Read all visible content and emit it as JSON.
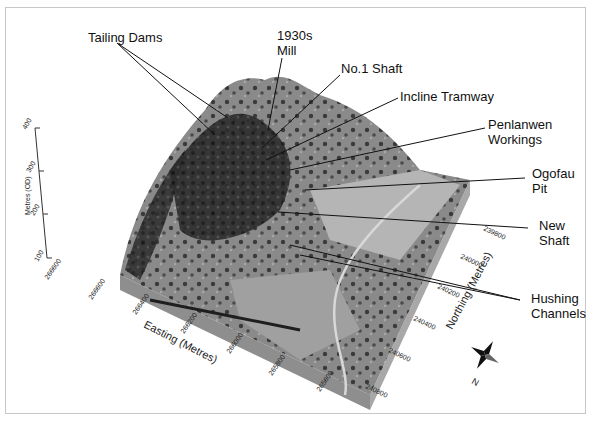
{
  "figure": {
    "type": "3D terrain model with aerial photo drape",
    "labels": {
      "tailing_dams": "Tailing Dams",
      "mill_l1": "1930s",
      "mill_l2": "Mill",
      "no1_shaft": "No.1 Shaft",
      "incline_tramway": "Incline Tramway",
      "penlanwen_l1": "Penlanwen",
      "penlanwen_l2": "Workings",
      "ogofau_l1": "Ogofau",
      "ogofau_l2": "Pit",
      "new_shaft_l1": "New",
      "new_shaft_l2": "Shaft",
      "hushing_l1": "Hushing",
      "hushing_l2": "Channels"
    },
    "axes": {
      "easting": {
        "title": "Easting (Metres)",
        "ticks": [
          "266600",
          "266400",
          "266200",
          "266000",
          "265800",
          "265600"
        ]
      },
      "northing": {
        "title": "Northing (Metres)",
        "ticks": [
          "239800",
          "240000",
          "240200",
          "240400",
          "240600",
          "240800"
        ]
      },
      "elevation": {
        "title": "Metres (OD)",
        "ticks": [
          "100",
          "200",
          "300",
          "400"
        ]
      },
      "corner_tick": "266600"
    },
    "north_arrow": {
      "label": "N"
    },
    "colors": {
      "terrain_dark": "#2a2a2a",
      "terrain_mid": "#7a7a7a",
      "terrain_light": "#b8b8b8",
      "block_side": "#9a9a9a",
      "frame": "#c8c8c8"
    }
  }
}
